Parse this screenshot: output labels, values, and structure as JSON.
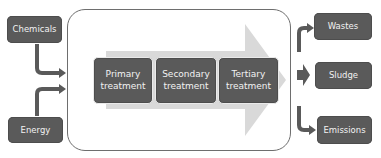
{
  "inputs": [
    {
      "label": "Chemicals"
    },
    {
      "label": "Energy"
    }
  ],
  "process": {
    "stages": [
      {
        "label": "Primary\ntreatment",
        "line1": "Primary",
        "line2": "treatment"
      },
      {
        "label": "Secondary\ntreatment",
        "line1": "Secondary",
        "line2": "treatment"
      },
      {
        "label": "Tertiary\ntreatment",
        "line1": "Tertiary",
        "line2": "treatment"
      }
    ]
  },
  "outputs": [
    {
      "label": "Wastes"
    },
    {
      "label": "Sludge"
    },
    {
      "label": "Emissions"
    }
  ],
  "colors": {
    "box_fill": "#5a5a5a",
    "box_text": "#f2f2f2",
    "big_arrow": "#d9d9d9",
    "connector": "#5a5a5a",
    "container_border": "#6e6e6e"
  }
}
